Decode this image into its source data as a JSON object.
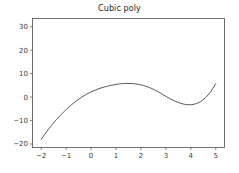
{
  "chart_data": {
    "type": "line",
    "title": "Cubic poly",
    "xlabel": "",
    "ylabel": "",
    "xlim": [
      -2.35,
      5.35
    ],
    "ylim": [
      -21.5,
      33.5
    ],
    "grid": false,
    "legend": null,
    "xticks": [
      -2,
      -1,
      0,
      1,
      2,
      3,
      4,
      5
    ],
    "xticklabels": [
      "−2",
      "−1",
      "0",
      "1",
      "2",
      "3",
      "4",
      "5"
    ],
    "yticks": [
      -20,
      -10,
      0,
      10,
      20,
      30
    ],
    "yticklabels": [
      "−20",
      "−10",
      "0",
      "10",
      "20",
      "30"
    ],
    "line_color": "#4a4a4a",
    "series": [
      {
        "name": "cubic",
        "x": [
          -2.0,
          -1.8,
          -1.6,
          -1.4,
          -1.2,
          -1.0,
          -0.8,
          -0.6,
          -0.4,
          -0.2,
          0.0,
          0.2,
          0.4,
          0.6,
          0.8,
          1.0,
          1.2,
          1.4,
          1.6,
          1.8,
          2.0,
          2.2,
          2.4,
          2.6,
          2.8,
          3.0,
          3.2,
          3.4,
          3.6,
          3.8,
          4.0,
          4.2,
          4.4,
          4.6,
          4.8,
          5.0
        ],
        "y": [
          -18.0,
          -15.0,
          -12.2,
          -9.7,
          -7.4,
          -5.3,
          -3.4,
          -1.7,
          -0.2,
          1.1,
          2.2,
          3.1,
          3.9,
          4.5,
          5.0,
          5.4,
          5.7,
          5.8,
          5.8,
          5.6,
          5.2,
          4.6,
          3.8,
          2.8,
          1.6,
          0.3,
          -0.9,
          -1.9,
          -2.7,
          -3.2,
          -3.3,
          -2.9,
          -1.9,
          -0.2,
          2.3,
          5.7
        ]
      }
    ]
  }
}
